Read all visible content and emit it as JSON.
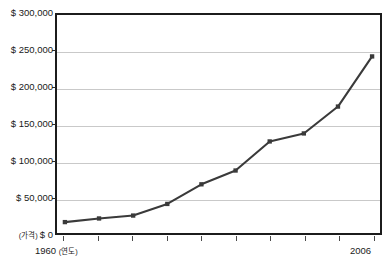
{
  "clipped_caption": "· · ·  · · · ·· ·  · · ·",
  "chart_data": {
    "type": "line",
    "title": "",
    "xlabel": "(연도)",
    "ylabel": "(가격)",
    "x": [
      1960,
      1965,
      1970,
      1975,
      1980,
      1985,
      1990,
      1995,
      2000,
      2006
    ],
    "values": [
      15000,
      20000,
      24000,
      40000,
      67000,
      86000,
      126000,
      137000,
      174000,
      243000
    ],
    "series": [
      {
        "name": "price",
        "values": [
          15000,
          20000,
          24000,
          40000,
          67000,
          86000,
          126000,
          137000,
          174000,
          243000
        ]
      }
    ],
    "ylim": [
      0,
      300000
    ],
    "yticks": [
      0,
      50000,
      100000,
      150000,
      200000,
      250000,
      300000
    ],
    "ytick_labels": [
      "$ 0",
      "$ 50,000",
      "$ 100,000",
      "$ 150,000",
      "$ 200,000",
      "$ 250,000",
      "$ 300,000"
    ],
    "y_zero_prefix": "(가격)",
    "y_zero_label": "$ 0",
    "xtick_labels": [
      "1960",
      "2006"
    ],
    "x_first_label": "1960",
    "x_first_unit": "(연도)",
    "x_last_label": "2006",
    "xtick_count": 10,
    "grid": true,
    "legend": "none",
    "series_color": "#3a3a3a",
    "grid_color": "#c9c9c9",
    "frame_color": "#1c1c1c"
  }
}
